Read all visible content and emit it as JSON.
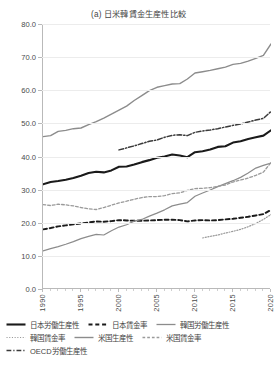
{
  "chart_data": {
    "type": "line",
    "title": "(a) 日米韓賃金生産性比較",
    "xlabel": "",
    "ylabel": "",
    "xlim": [
      1990,
      2020
    ],
    "ylim": [
      0.0,
      80.0
    ],
    "grid": true,
    "legend_position": "bottom",
    "yticks": [
      "0.0",
      "10.0",
      "20.0",
      "30.0",
      "40.0",
      "50.0",
      "60.0",
      "70.0",
      "80.0"
    ],
    "ytick_values": [
      0,
      10,
      20,
      30,
      40,
      50,
      60,
      70,
      80
    ],
    "xticks": [
      "1990",
      "1995",
      "2000",
      "2005",
      "2010",
      "2015",
      "2020"
    ],
    "xtick_values": [
      1990,
      1995,
      2000,
      2005,
      2010,
      2015,
      2020
    ],
    "x": [
      1990,
      1991,
      1992,
      1993,
      1994,
      1995,
      1996,
      1997,
      1998,
      1999,
      2000,
      2001,
      2002,
      2003,
      2004,
      2005,
      2006,
      2007,
      2008,
      2009,
      2010,
      2011,
      2012,
      2013,
      2014,
      2015,
      2016,
      2017,
      2018,
      2019,
      2020
    ],
    "series": [
      {
        "name": "日本労働生産性",
        "style": "solid",
        "color": "#1a1a1a",
        "width": 2.1,
        "values": [
          31.6,
          32.3,
          32.6,
          33.0,
          33.5,
          34.2,
          35.0,
          35.4,
          35.2,
          35.8,
          36.9,
          37.0,
          37.6,
          38.3,
          38.9,
          39.6,
          40.0,
          40.6,
          40.3,
          39.8,
          41.3,
          41.6,
          42.1,
          42.9,
          43.1,
          44.2,
          44.6,
          45.3,
          45.8,
          46.3,
          47.9
        ]
      },
      {
        "name": "日本賃金率",
        "style": "dashed",
        "color": "#1a1a1a",
        "width": 1.9,
        "values": [
          18.0,
          18.4,
          18.9,
          19.2,
          19.5,
          19.8,
          20.1,
          20.4,
          20.3,
          20.5,
          20.8,
          20.7,
          20.6,
          20.6,
          20.7,
          20.8,
          20.9,
          20.9,
          20.8,
          20.4,
          20.7,
          20.8,
          20.7,
          20.8,
          21.0,
          21.2,
          21.5,
          21.8,
          22.2,
          22.6,
          23.9
        ]
      },
      {
        "name": "韓国労働生産性",
        "style": "solid",
        "color": "#8c8c8c",
        "width": 1.2,
        "values": [
          11.5,
          12.2,
          12.8,
          13.5,
          14.3,
          15.2,
          15.9,
          16.5,
          16.3,
          17.6,
          18.7,
          19.4,
          20.5,
          21.0,
          22.0,
          22.9,
          23.9,
          25.1,
          25.6,
          26.1,
          28.0,
          29.0,
          29.9,
          30.9,
          31.8,
          32.7,
          33.7,
          35.0,
          36.5,
          37.3,
          38.0
        ]
      },
      {
        "name": "韓国賃金率",
        "style": "dotted",
        "color": "#9a9a9a",
        "width": 1.2,
        "values": [
          null,
          null,
          null,
          null,
          null,
          null,
          null,
          null,
          null,
          null,
          null,
          null,
          null,
          null,
          null,
          null,
          null,
          null,
          null,
          null,
          null,
          15.4,
          15.9,
          16.3,
          16.9,
          17.4,
          18.0,
          18.8,
          19.8,
          21.0,
          22.5
        ]
      },
      {
        "name": "米国生産性",
        "style": "solid",
        "color": "#8c8c8c",
        "width": 1.4,
        "values": [
          46.0,
          46.3,
          47.6,
          47.9,
          48.4,
          48.6,
          49.6,
          50.5,
          51.6,
          52.8,
          54.0,
          55.2,
          56.9,
          58.4,
          59.9,
          60.9,
          61.4,
          61.9,
          62.0,
          63.4,
          65.2,
          65.6,
          66.0,
          66.5,
          67.0,
          67.8,
          68.1,
          68.8,
          69.6,
          70.5,
          74.0
        ]
      },
      {
        "name": "米国賃金率",
        "style": "dashed",
        "color": "#9a9a9a",
        "width": 1.3,
        "values": [
          25.5,
          25.2,
          25.6,
          25.4,
          25.1,
          24.6,
          24.2,
          24.0,
          24.6,
          25.3,
          26.0,
          26.5,
          27.1,
          27.6,
          27.9,
          27.9,
          28.2,
          28.8,
          29.0,
          29.8,
          30.3,
          30.4,
          30.6,
          31.0,
          31.4,
          32.3,
          32.9,
          33.5,
          34.3,
          35.3,
          38.2
        ]
      },
      {
        "name": "OECD労働生産性",
        "style": "dashdot",
        "color": "#3a3a3a",
        "width": 1.5,
        "values": [
          null,
          null,
          null,
          null,
          null,
          null,
          null,
          null,
          null,
          null,
          42.0,
          42.6,
          43.2,
          43.9,
          44.6,
          45.0,
          45.8,
          46.4,
          46.6,
          46.3,
          47.3,
          47.7,
          48.0,
          48.4,
          48.9,
          49.4,
          49.8,
          50.4,
          51.0,
          51.5,
          53.6
        ]
      }
    ]
  },
  "legend": {
    "items": [
      {
        "label": "日本労働生産性",
        "style": "solid",
        "color": "#1a1a1a",
        "width": 2.1
      },
      {
        "label": "日本賃金率",
        "style": "dashed",
        "color": "#1a1a1a",
        "width": 1.9
      },
      {
        "label": "韓国労働生産性",
        "style": "solid",
        "color": "#8c8c8c",
        "width": 1.3
      },
      {
        "label": "韓国賃金率",
        "style": "dotted",
        "color": "#9a9a9a",
        "width": 1.2
      },
      {
        "label": "米国生産性",
        "style": "solid",
        "color": "#8c8c8c",
        "width": 1.4
      },
      {
        "label": "米国賃金率",
        "style": "dashed",
        "color": "#9a9a9a",
        "width": 1.3
      },
      {
        "label": "OECD労働生産性",
        "style": "dashdot",
        "color": "#3a3a3a",
        "width": 1.5
      }
    ]
  },
  "colors": {
    "axis": "#b9b9b9",
    "grid": "#ececec",
    "text": "#454545",
    "background": "#ffffff"
  }
}
